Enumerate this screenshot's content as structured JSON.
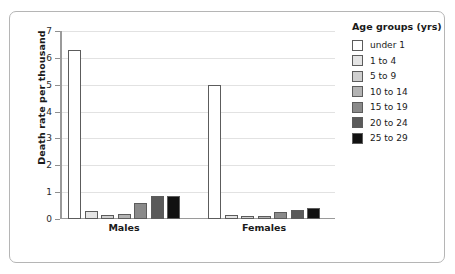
{
  "chart_data": {
    "type": "bar",
    "title": "",
    "xlabel": "",
    "ylabel": "Death rate per thousand",
    "ylim": [
      0,
      7
    ],
    "yticks": [
      0,
      1,
      2,
      3,
      4,
      5,
      6,
      7
    ],
    "grid": true,
    "legend_position": "right",
    "legend_title": "Age groups (yrs)",
    "categories": [
      "Males",
      "Females"
    ],
    "series": [
      {
        "name": "under 1",
        "color": "#ffffff",
        "values": [
          6.3,
          5.0
        ]
      },
      {
        "name": "1 to 4",
        "color": "#e4e4e4",
        "values": [
          0.3,
          0.15
        ]
      },
      {
        "name": "5 to 9",
        "color": "#cfcfcf",
        "values": [
          0.15,
          0.1
        ]
      },
      {
        "name": "10 to 14",
        "color": "#b3b3b3",
        "values": [
          0.2,
          0.12
        ]
      },
      {
        "name": "15 to 19",
        "color": "#8a8a8a",
        "values": [
          0.6,
          0.25
        ]
      },
      {
        "name": "20 to 24",
        "color": "#5a5a5a",
        "values": [
          0.85,
          0.35
        ]
      },
      {
        "name": "25 to 29",
        "color": "#111111",
        "values": [
          0.85,
          0.4
        ]
      }
    ]
  },
  "legend": {
    "title": "Age groups (yrs)",
    "items": [
      {
        "label": "under 1"
      },
      {
        "label": "1 to 4"
      },
      {
        "label": "5 to 9"
      },
      {
        "label": "10 to 14"
      },
      {
        "label": "15 to 19"
      },
      {
        "label": "20 to 24"
      },
      {
        "label": "25 to 29"
      }
    ]
  },
  "axes": {
    "y_title": "Death rate per thousand",
    "y_tick_labels": [
      "7",
      "6",
      "5",
      "4",
      "3",
      "2",
      "1",
      "0"
    ],
    "x_tick_labels": [
      "Males",
      "Females"
    ]
  }
}
